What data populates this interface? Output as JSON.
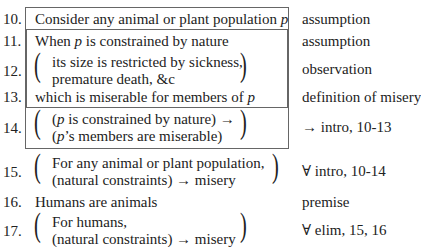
{
  "proof": {
    "lines": [
      {
        "num": "10.",
        "text": "Consider any animal or plant population ",
        "var": "p",
        "justification": "assumption"
      },
      {
        "num": "11.",
        "text_pre": "When ",
        "var": "p",
        "text_post": " is constrained by nature",
        "justification": "assumption"
      },
      {
        "num": "12.",
        "text1": "its size is restricted by sickness,",
        "text2": "premature death, &c",
        "justification": "observation"
      },
      {
        "num": "13.",
        "text": "which is miserable for members of ",
        "var": "p",
        "justification": "definition of misery"
      },
      {
        "num": "14.",
        "text1_pre": "(",
        "var": "p",
        "text1_post": " is constrained by nature) →",
        "text2_pre": "(",
        "text2_post": "’s members are miserable)",
        "justification": "→ intro, 10-13"
      },
      {
        "num": "15.",
        "text1": "For any animal or plant population,",
        "text2": "(natural constraints) → misery",
        "justification": "∀ intro, 10-14"
      },
      {
        "num": "16.",
        "text": "Humans are animals",
        "justification": "premise"
      },
      {
        "num": "17.",
        "text1": "For humans,",
        "text2": "(natural constraints) → misery",
        "justification": "∀ elim, 15, 16"
      }
    ]
  }
}
